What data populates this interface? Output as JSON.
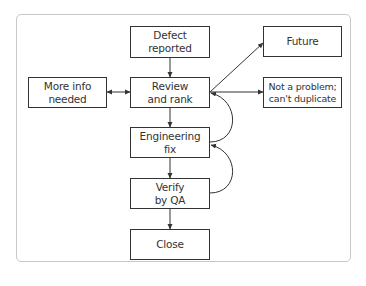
{
  "diagram": {
    "type": "flowchart",
    "nodes": [
      {
        "id": "defect",
        "label": "Defect\nreported"
      },
      {
        "id": "review",
        "label": "Review\nand rank"
      },
      {
        "id": "moreinfo",
        "label": "More info\nneeded"
      },
      {
        "id": "engfix",
        "label": "Engineering\nfix"
      },
      {
        "id": "verify",
        "label": "Verify\nby QA"
      },
      {
        "id": "close",
        "label": "Close"
      },
      {
        "id": "future",
        "label": "Future"
      },
      {
        "id": "notproblem",
        "label": "Not a problem;\ncan't duplicate"
      }
    ],
    "edges": [
      {
        "from": "defect",
        "to": "review"
      },
      {
        "from": "review",
        "to": "moreinfo",
        "bidirectional": true
      },
      {
        "from": "review",
        "to": "engfix"
      },
      {
        "from": "engfix",
        "to": "verify"
      },
      {
        "from": "verify",
        "to": "close"
      },
      {
        "from": "review",
        "to": "future"
      },
      {
        "from": "review",
        "to": "notproblem"
      },
      {
        "from": "engfix",
        "to": "review",
        "curved": true
      },
      {
        "from": "verify",
        "to": "engfix",
        "curved": true
      }
    ],
    "colors": {
      "stroke": "#333333",
      "frame": "#c8c8c8",
      "background": "#ffffff"
    }
  }
}
